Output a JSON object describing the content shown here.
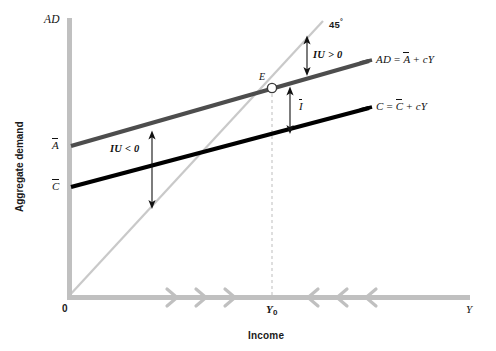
{
  "figure": {
    "type": "line",
    "axes": {
      "y_axis_top_label": "AD",
      "y_axis_title": "Aggregate demand",
      "x_axis_title": "Income",
      "x_axis_end_label": "Y",
      "origin_label": "0"
    },
    "tick_labels": {
      "y_a_bar": "A",
      "y_c_bar": "C",
      "x_equilibrium": "Y",
      "x_equilibrium_sub": "0"
    },
    "curves": [
      {
        "name": "aggregate-demand-line",
        "label": "AD = A + cY",
        "label_plain": "AD",
        "color": "#4d4d4d",
        "intercept_label": "A"
      },
      {
        "name": "consumption-line",
        "label": "C = C + cY",
        "label_plain": "C",
        "color": "#000000",
        "intercept_label": "C"
      },
      {
        "name": "forty-five-degree-line",
        "label": "45",
        "label_suffix": "°",
        "color": "#c9c9c9"
      }
    ],
    "annotations": [
      {
        "name": "equilibrium-point",
        "label": "E"
      },
      {
        "name": "unplanned-inventory-positive",
        "label": "IU > 0"
      },
      {
        "name": "unplanned-inventory-negative",
        "label": "IU < 0"
      },
      {
        "name": "autonomous-investment",
        "label": "I"
      }
    ],
    "colors": {
      "axis": "#c0c0c0",
      "ad_line": "#4d4d4d",
      "c_line": "#000000",
      "ref_line": "#c9c9c9",
      "dashed": "#b8b8b8",
      "text": "#111111"
    }
  }
}
